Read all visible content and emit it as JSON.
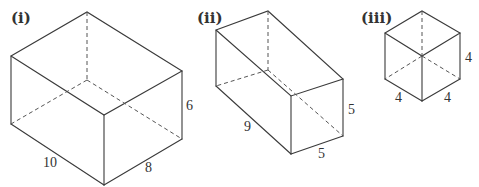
{
  "diagram": {
    "type": "cuboid-figures",
    "colors": {
      "stroke": "#3a3a3a",
      "text": "#333333",
      "background": "#ffffff"
    },
    "figures": [
      {
        "label": "(i)",
        "dimensions": {
          "length": "10",
          "width": "8",
          "height": "6"
        }
      },
      {
        "label": "(ii)",
        "dimensions": {
          "length": "9",
          "width": "5",
          "height": "5"
        }
      },
      {
        "label": "(iii)",
        "dimensions": {
          "length": "4",
          "width": "4",
          "height": "4"
        }
      }
    ]
  }
}
